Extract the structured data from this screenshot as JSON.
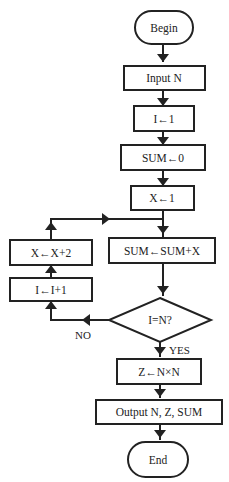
{
  "diagram": {
    "type": "flowchart",
    "nodes": [
      {
        "id": "begin",
        "shape": "terminal",
        "label": "Begin"
      },
      {
        "id": "input",
        "shape": "process",
        "label": "Input N"
      },
      {
        "id": "init_i",
        "shape": "process",
        "label": "I←1"
      },
      {
        "id": "init_sum",
        "shape": "process",
        "label": "SUM←0"
      },
      {
        "id": "init_x",
        "shape": "process",
        "label": "X←1"
      },
      {
        "id": "accumulate",
        "shape": "process",
        "label": "SUM←SUM+X"
      },
      {
        "id": "decision",
        "shape": "decision",
        "label": "I=N?"
      },
      {
        "id": "inc_i",
        "shape": "process",
        "label": "I←I+1"
      },
      {
        "id": "inc_x",
        "shape": "process",
        "label": "X←X+2"
      },
      {
        "id": "square",
        "shape": "process",
        "label": "Z←N×N"
      },
      {
        "id": "output",
        "shape": "process",
        "label": "Output N, Z, SUM"
      },
      {
        "id": "end",
        "shape": "terminal",
        "label": "End"
      }
    ],
    "edges": [
      {
        "from": "begin",
        "to": "input",
        "label": ""
      },
      {
        "from": "input",
        "to": "init_i",
        "label": ""
      },
      {
        "from": "init_i",
        "to": "init_sum",
        "label": ""
      },
      {
        "from": "init_sum",
        "to": "init_x",
        "label": ""
      },
      {
        "from": "init_x",
        "to": "accumulate",
        "label": ""
      },
      {
        "from": "accumulate",
        "to": "decision",
        "label": ""
      },
      {
        "from": "decision",
        "to": "inc_i",
        "label": "NO"
      },
      {
        "from": "inc_i",
        "to": "inc_x",
        "label": ""
      },
      {
        "from": "inc_x",
        "to": "accumulate",
        "label": ""
      },
      {
        "from": "decision",
        "to": "square",
        "label": "YES"
      },
      {
        "from": "square",
        "to": "output",
        "label": ""
      },
      {
        "from": "output",
        "to": "end",
        "label": ""
      }
    ],
    "edge_labels": {
      "no": "NO",
      "yes": "YES"
    }
  }
}
